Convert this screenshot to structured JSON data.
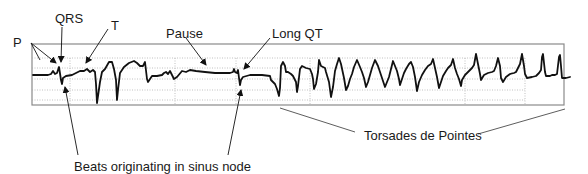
{
  "diagram": {
    "type": "ecg-strip",
    "labels": {
      "p": "P",
      "qrs": "QRS",
      "t": "T",
      "pause": "Pause",
      "long_qt": "Long QT",
      "sinus_beats": "Beats originating in sinus node",
      "torsades": "Torsades de Pointes"
    },
    "colors": {
      "trace": "#111111",
      "frame": "#888888",
      "grid": "#9a9a9a",
      "annotation": "#333333"
    }
  }
}
